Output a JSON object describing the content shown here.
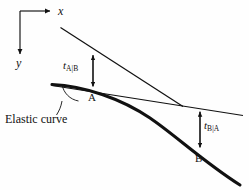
{
  "figure": {
    "background_color": "#fefefe",
    "ink_color": "#111111",
    "width": 249,
    "height": 190
  },
  "axes": {
    "x_label": "x",
    "y_label": "y",
    "origin": [
      20,
      11
    ],
    "x_arrow_tip": [
      54,
      11
    ],
    "y_arrow_tip": [
      20,
      58
    ]
  },
  "points": {
    "a_label": "A",
    "b_label": "B"
  },
  "deviations": {
    "t_ab": {
      "symbol": "t",
      "subscript": "A|B"
    },
    "t_ba": {
      "symbol": "t",
      "subscript": "B|A"
    }
  },
  "annotations": {
    "elastic_curve_label": "Elastic curve"
  },
  "bleed_through": {
    "line1": "",
    "line2": "",
    "line3": ""
  }
}
